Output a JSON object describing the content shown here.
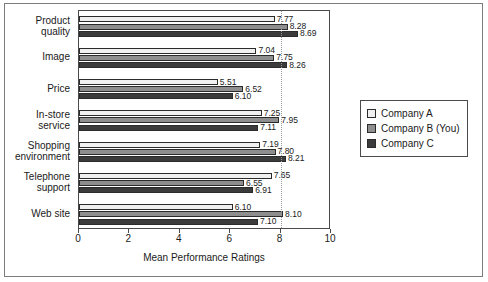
{
  "chart_data": {
    "type": "bar",
    "orientation": "horizontal",
    "title": "",
    "xlabel": "Mean Performance Ratings",
    "ylabel": "",
    "xlim": [
      0,
      10
    ],
    "xticks": [
      0,
      2,
      4,
      6,
      8,
      10
    ],
    "grid": "dotted vertical gridline at x=8",
    "legend_position": "right",
    "categories": [
      "Product quality",
      "Image",
      "Price",
      "In-store service",
      "Shopping environment",
      "Telephone support",
      "Web site"
    ],
    "series": [
      {
        "name": "Company A",
        "color": "#f0f0f0",
        "values": [
          7.77,
          7.04,
          5.51,
          7.25,
          7.19,
          7.65,
          6.1
        ]
      },
      {
        "name": "Company B (You)",
        "color": "#8e8e8e",
        "values": [
          8.28,
          7.75,
          6.52,
          7.95,
          7.8,
          6.55,
          8.1
        ]
      },
      {
        "name": "Company C",
        "color": "#3b3b3b",
        "values": [
          8.69,
          8.26,
          6.1,
          7.11,
          8.21,
          6.91,
          7.1
        ]
      }
    ]
  },
  "category_labels": [
    [
      "Product",
      "quality"
    ],
    [
      "Image"
    ],
    [
      "Price"
    ],
    [
      "In-store",
      "service"
    ],
    [
      "Shopping",
      "environment"
    ],
    [
      "Telephone",
      "support"
    ],
    [
      "Web site"
    ]
  ],
  "axis": {
    "title": "Mean Performance Ratings",
    "tick_labels": [
      "0",
      "2",
      "4",
      "6",
      "8",
      "10"
    ]
  },
  "legend": {
    "items": [
      {
        "label": "Company A",
        "color": "#f0f0f0"
      },
      {
        "label": "Company B (You)",
        "color": "#8e8e8e"
      },
      {
        "label": "Company C",
        "color": "#3b3b3b"
      }
    ]
  }
}
